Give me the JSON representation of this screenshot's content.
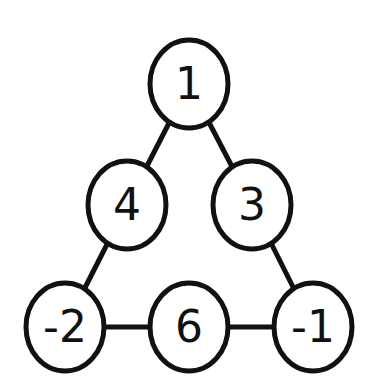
{
  "diagram": {
    "type": "number-triangle",
    "colors": {
      "stroke": "#111111",
      "fill": "#ffffff",
      "background": "#ffffff"
    },
    "nodes": [
      {
        "id": "top",
        "label": "1",
        "cx": 189,
        "cy": 84
      },
      {
        "id": "mid-left",
        "label": "4",
        "cx": 127,
        "cy": 205
      },
      {
        "id": "mid-right",
        "label": "3",
        "cx": 252,
        "cy": 205
      },
      {
        "id": "bottom-left",
        "label": "-2",
        "cx": 65,
        "cy": 327
      },
      {
        "id": "bottom-mid",
        "label": "6",
        "cx": 189,
        "cy": 327
      },
      {
        "id": "bottom-right",
        "label": "-1",
        "cx": 313,
        "cy": 327
      }
    ],
    "edges": [
      [
        "top",
        "mid-left"
      ],
      [
        "top",
        "mid-right"
      ],
      [
        "mid-left",
        "bottom-left"
      ],
      [
        "mid-right",
        "bottom-right"
      ],
      [
        "bottom-left",
        "bottom-mid"
      ],
      [
        "bottom-mid",
        "bottom-right"
      ]
    ]
  }
}
